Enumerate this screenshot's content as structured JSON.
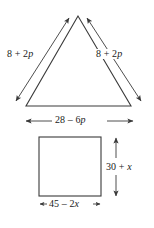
{
  "figure": {
    "stroke_color": "#3a3a3a",
    "text_color": "#1a1a1a",
    "background_color": "#ffffff",
    "shapes": [
      {
        "name": "triangle",
        "type": "triangle",
        "vertices": [
          [
            78,
            16
          ],
          [
            26,
            106
          ],
          [
            131,
            106
          ]
        ]
      },
      {
        "name": "square",
        "type": "rectangle",
        "x": 39,
        "y": 137,
        "width": 62,
        "height": 59
      }
    ]
  },
  "labels": {
    "triangle_left_side": {
      "text": "8 + 2p",
      "const": "8 + 2",
      "var": "p"
    },
    "triangle_right_side": {
      "text": "8 + 2p",
      "const": "8 + 2",
      "var": "p"
    },
    "triangle_base": {
      "text": "28 – 6p",
      "const": "28 – 6",
      "var": "p"
    },
    "square_height": {
      "text": "30 + x",
      "const": "30 + ",
      "var": "x"
    },
    "square_width": {
      "text": "45 – 2x",
      "const": "45 – 2",
      "var": "x"
    }
  }
}
